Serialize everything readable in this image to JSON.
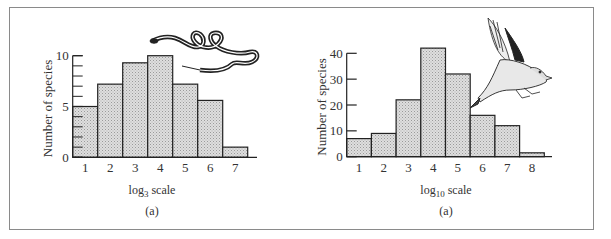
{
  "chart_data": [
    {
      "type": "bar",
      "title": "",
      "caption": "(a)",
      "xlabel": "log",
      "xlabel_sub": "3",
      "xlabel_suffix": " scale",
      "ylabel": "Number of species",
      "categories": [
        "1",
        "2",
        "3",
        "4",
        "5",
        "6",
        "7"
      ],
      "values": [
        5,
        7.2,
        9.3,
        10,
        7.2,
        5.6,
        1
      ],
      "ylim": [
        0,
        10
      ],
      "yticks": [
        0,
        5,
        10
      ],
      "minor_ticks_every": 1,
      "grid": false,
      "illustration": "snake",
      "bar_color": "#d4d4d4"
    },
    {
      "type": "bar",
      "title": "",
      "caption": "(a)",
      "xlabel": "log",
      "xlabel_sub": "10",
      "xlabel_suffix": " scale",
      "ylabel": "Number of species",
      "categories": [
        "1",
        "2",
        "3",
        "4",
        "5",
        "6",
        "7",
        "8"
      ],
      "values": [
        7,
        9,
        22,
        42,
        32,
        16,
        12,
        1.5
      ],
      "ylim": [
        0,
        40
      ],
      "yticks": [
        0,
        10,
        20,
        30,
        40
      ],
      "grid": false,
      "illustration": "bird",
      "bar_color": "#d4d4d4"
    }
  ]
}
